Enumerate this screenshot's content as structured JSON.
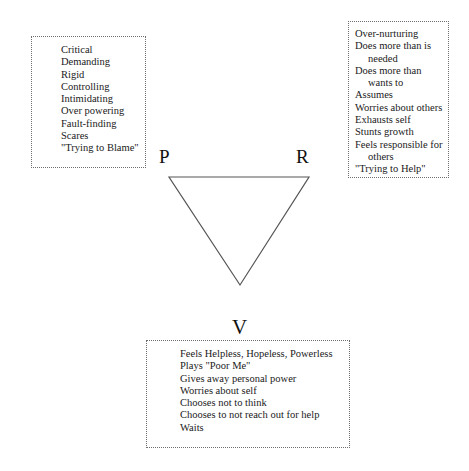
{
  "diagram": {
    "type": "drama-triangle",
    "vertices": {
      "persecutor": {
        "label": "P"
      },
      "rescuer": {
        "label": "R"
      },
      "victim": {
        "label": "V"
      }
    },
    "boxes": {
      "persecutor": {
        "items": [
          "Critical",
          "Demanding",
          "Rigid",
          "Controlling",
          "Intimidating",
          "Over powering",
          "Fault-finding",
          "Scares",
          "\"Trying to Blame\""
        ]
      },
      "rescuer": {
        "items": [
          {
            "text": "Over-nurturing"
          },
          {
            "text": "Does more than is",
            "cont": "needed"
          },
          {
            "text": "Does more than",
            "cont": "wants to"
          },
          {
            "text": "Assumes"
          },
          {
            "text": "Worries about others"
          },
          {
            "text": "Exhausts self"
          },
          {
            "text": "Stunts growth"
          },
          {
            "text": "Feels responsible for",
            "cont": "others"
          },
          {
            "text": "\"Trying to Help\""
          }
        ]
      },
      "victim": {
        "items": [
          "Feels Helpless, Hopeless, Powerless",
          "Plays \"Poor Me\"",
          "Gives away personal power",
          "Worries about self",
          "Chooses not to think",
          "Chooses to not reach out for help",
          "Waits"
        ]
      }
    },
    "colors": {
      "line": "#555555",
      "box_border": "#6e6e6e",
      "text": "#1a1a1a"
    }
  }
}
